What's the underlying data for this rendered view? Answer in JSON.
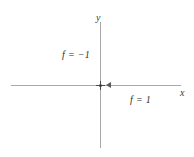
{
  "figure": {
    "background_color": "#ffffff",
    "axis_color": "#a8a8a8",
    "text_color": "#2e2e2e",
    "marker_color": "#3c3c3c"
  },
  "axes": {
    "x_label": "x",
    "y_label": "y"
  },
  "labels": {
    "f_negative_one": "f = −1",
    "f_positive_one": "f = 1"
  },
  "chart_data": {
    "type": "diagram",
    "title": "",
    "xlabel": "x",
    "ylabel": "y",
    "grid": false,
    "legend": "none",
    "annotations": [
      {
        "text": "f = −1",
        "region": "upper-left",
        "value": -1
      },
      {
        "text": "f = 1",
        "region": "lower-right",
        "value": 1
      }
    ],
    "markers": [
      {
        "name": "origin",
        "x": 0,
        "y": 0
      }
    ]
  }
}
